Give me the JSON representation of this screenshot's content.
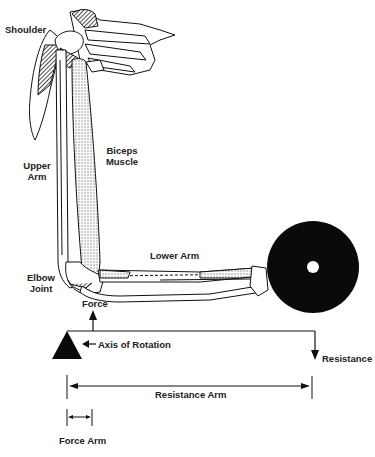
{
  "diagram": {
    "title": "",
    "labels": {
      "shoulder": "Shoulder",
      "biceps_line1": "Biceps",
      "biceps_line2": "Muscle",
      "upper_arm_line1": "Upper",
      "upper_arm_line2": "Arm",
      "lower_arm": "Lower Arm",
      "elbow_line1": "Elbow",
      "elbow_line2": "Joint",
      "force": "Force",
      "axis_of_rotation": "Axis of Rotation",
      "resistance": "Resistance",
      "resistance_arm": "Resistance Arm",
      "force_arm": "Force Arm"
    },
    "colors": {
      "ink": "#111111",
      "muscle_hatch": "#9a9a9a",
      "weight": "#0a0a0a",
      "background": "#ffffff"
    }
  }
}
